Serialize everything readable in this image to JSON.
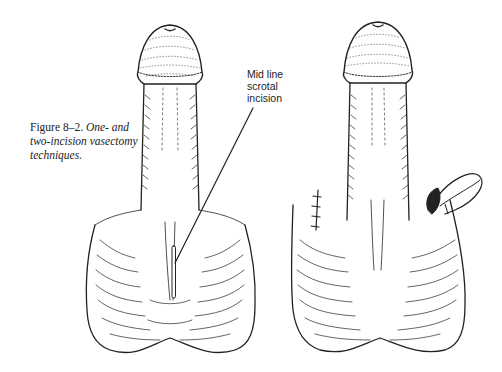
{
  "caption": {
    "label": "Figure 8–2.",
    "text": "One- and two-incision vasectomy techniques."
  },
  "callout": {
    "lines": [
      "Mid line",
      "scrotal",
      "incision"
    ]
  },
  "illustrations": [
    {
      "name": "one-incision-technique",
      "feature": "mid line scrotal incision"
    },
    {
      "name": "two-incision-technique",
      "feature": "sutured incision left, exposed vas loop right"
    }
  ]
}
